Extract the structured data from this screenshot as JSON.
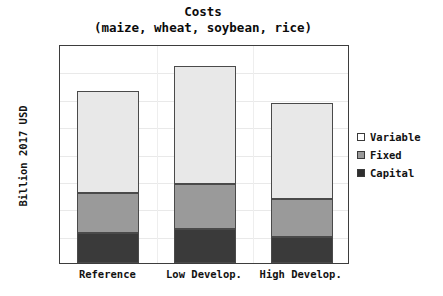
{
  "chart_data": {
    "type": "bar",
    "stacked": true,
    "title": "Costs",
    "subtitle": "(maize, wheat, soybean, rice)",
    "xlabel": "",
    "ylabel": "Billion 2017 USD",
    "categories": [
      "Reference",
      "Low Develop.",
      "High Develop."
    ],
    "series": [
      {
        "name": "Capital",
        "values": [
          55,
          62,
          48
        ]
      },
      {
        "name": "Fixed",
        "values": [
          73,
          83,
          69
        ]
      },
      {
        "name": "Variable",
        "values": [
          187,
          215,
          175
        ]
      }
    ],
    "totals": [
      315,
      360,
      292
    ],
    "ylim": [
      0,
      400
    ],
    "yticks": [
      0,
      50,
      100,
      150,
      200,
      250,
      300,
      350,
      400
    ],
    "ytick_labels": [
      "0",
      "50",
      "100",
      "150",
      "200",
      "250",
      "300",
      "350",
      "400"
    ],
    "grid": true,
    "legend": {
      "position": "right-outside",
      "entries": [
        {
          "label": "Variable",
          "color": "#e8e8e8",
          "swatch": "white"
        },
        {
          "label": "Fixed",
          "color": "#9a9a9a",
          "swatch": "gray"
        },
        {
          "label": "Capital",
          "color": "#3a3a3a",
          "swatch": "black"
        }
      ]
    },
    "colors": {
      "variable": "#e8e8e8",
      "fixed": "#9a9a9a",
      "capital": "#3a3a3a",
      "edge": "#4a4a4a",
      "axis": "#3d3d3d",
      "text": "#121212",
      "grid": "#e9e9e9",
      "background": "#ffffff"
    }
  }
}
